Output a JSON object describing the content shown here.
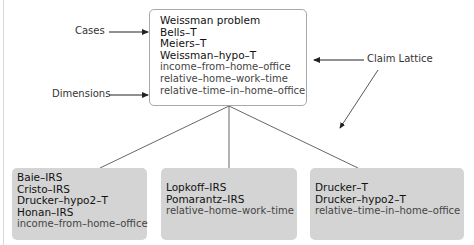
{
  "annotations": {
    "cases": "Cases",
    "dimensions": "Dimensions",
    "claim_lattice": "Claim Lattice"
  },
  "root_node": {
    "cases": [
      "Weissman problem",
      "Bells–T",
      "Meiers–T",
      "Weissman–hypo–T"
    ],
    "dimensions": [
      "income–from–home–office",
      "relative–home–work–time",
      "relative–time–in–home–office"
    ]
  },
  "child_nodes": [
    {
      "cases": [
        "Baie–IRS",
        "Cristo–IRS",
        "Drucker–hypo2–T",
        "Honan–IRS"
      ],
      "dimensions": [
        "income–from–home–office"
      ]
    },
    {
      "cases": [
        "Lopkoff–IRS",
        "Pomarantz–IRS"
      ],
      "dimensions": [
        "relative–home–work–time"
      ]
    },
    {
      "cases": [
        "Drucker–T",
        "Drucker–hypo2–T"
      ],
      "dimensions": [
        "relative–time–in–home–office"
      ]
    }
  ],
  "colors": {
    "root_fill": "#ffffff",
    "root_border": "#a9a9a9",
    "child_fill": "#d4d4d4",
    "edge": "#555555"
  }
}
